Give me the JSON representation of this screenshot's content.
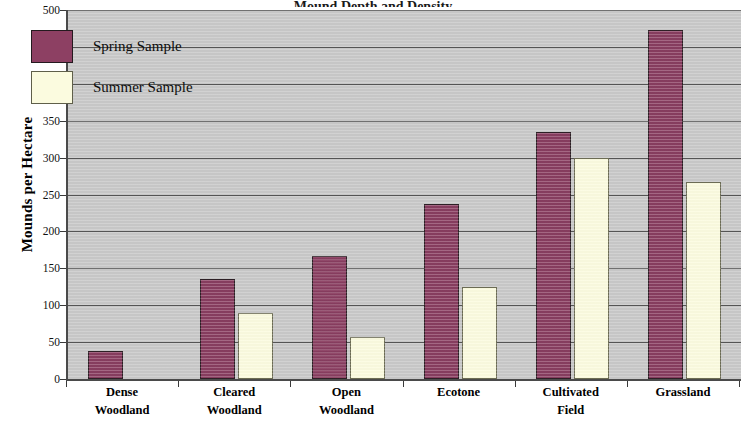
{
  "chart_data": {
    "type": "bar",
    "title": "Mound Depth and Density",
    "xlabel": "",
    "ylabel": "Mounds per Hectare",
    "categories": [
      "Dense Woodland",
      "Cleared Woodland",
      "Open Woodland",
      "Ecotone",
      "Cultivated Field",
      "Grassland"
    ],
    "category_lines": [
      [
        "Dense",
        "Woodland"
      ],
      [
        "Cleared",
        "Woodland"
      ],
      [
        "Open",
        "Woodland"
      ],
      [
        "Ecotone"
      ],
      [
        "Cultivated",
        "Field"
      ],
      [
        "Grassland"
      ]
    ],
    "series": [
      {
        "name": "Spring Sample",
        "color": "#8d4063",
        "values": [
          38,
          135,
          167,
          237,
          335,
          473
        ]
      },
      {
        "name": "Summer Sample",
        "color": "#fbfbdf",
        "values": [
          0,
          90,
          57,
          125,
          300,
          267
        ]
      }
    ],
    "ylim": [
      0,
      500
    ],
    "ytick_values": [
      0,
      50,
      100,
      150,
      200,
      250,
      300,
      350,
      400,
      450,
      500
    ],
    "ytick_labels": [
      "0",
      "50",
      "100",
      "150",
      "200",
      "250",
      "300",
      "350",
      "400",
      "450",
      "500"
    ],
    "grid": true,
    "grid_axis": "y",
    "legend_position": "upper-left-inside",
    "plot_background": "#c9c9c9",
    "figure_background": "#ffffff",
    "axis_color": "#4a4a4a"
  }
}
